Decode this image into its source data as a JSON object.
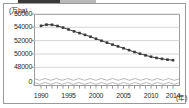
{
  "chart_data": {
    "type": "line",
    "title": "",
    "subtitle": "",
    "xlabel": "年",
    "ylabel": "万ha",
    "unit_label": "(万ha)",
    "xaxis_unit_label": "(年)",
    "grid": "horizontal",
    "legend_position": "none",
    "axis_break": true,
    "axis_break_note": "y-axis broken between 0 and 48000",
    "ylim": [
      47000,
      56000
    ],
    "yticks": [
      48000,
      50000,
      52000,
      54000,
      56000
    ],
    "ytick_labels": [
      "48000",
      "50000",
      "52000",
      "54000",
      "56000"
    ],
    "zero_tick_label": "0",
    "xlim": [
      1990,
      2014
    ],
    "xticks": [
      1990,
      1995,
      2000,
      2005,
      2010,
      2014
    ],
    "xtick_labels": [
      "1990",
      "1995",
      "2000",
      "2005",
      "2010",
      "2014"
    ],
    "marker": "small filled square",
    "line_color": "#3a3a3a",
    "grid_color": "#c8c8c8",
    "frame_color": "#9a9a9a",
    "x": [
      1990,
      1991,
      1992,
      1993,
      1994,
      1995,
      1996,
      1997,
      1998,
      1999,
      2000,
      2001,
      2002,
      2003,
      2004,
      2005,
      2006,
      2007,
      2008,
      2009,
      2010,
      2011,
      2012,
      2013,
      2014
    ],
    "series": [
      {
        "name": "耕地面積",
        "values": [
          54230,
          54400,
          54380,
          54200,
          53960,
          53680,
          53400,
          53140,
          52870,
          52590,
          52290,
          51990,
          51700,
          51410,
          51140,
          50860,
          50580,
          50300,
          50040,
          49800,
          49590,
          49410,
          49270,
          49150,
          49070
        ]
      }
    ]
  }
}
